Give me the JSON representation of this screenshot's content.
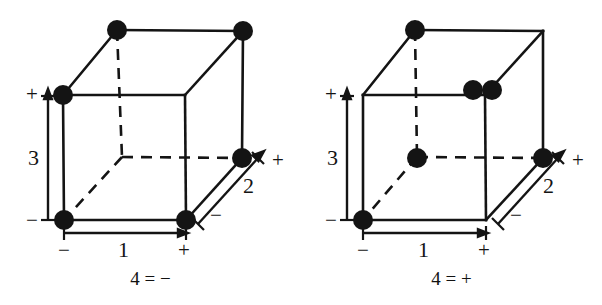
{
  "figure": {
    "type": "two-panel-cube-diagram",
    "background_color": "#ffffff",
    "line_color": "#141414",
    "dot_color": "#141414",
    "width": 602,
    "height": 305
  },
  "geometry": {
    "front_face": {
      "top_left": [
        63,
        95
      ],
      "top_right": [
        185,
        95
      ],
      "bottom_left": [
        64,
        220
      ],
      "bottom_right": [
        186,
        220
      ]
    },
    "back_face": {
      "top_left": [
        117,
        30
      ],
      "top_right": [
        243,
        31
      ],
      "bottom_left": [
        122,
        157
      ],
      "bottom_right": [
        242,
        158
      ]
    },
    "hidden_edges_dashed": [
      "back_bottom_left-back_top_left",
      "back_bottom_left-back_bottom_right",
      "back_bottom_left-front_bottom_left"
    ]
  },
  "axes": {
    "axis_1": {
      "name": "1",
      "minus": "−",
      "plus": "+",
      "orientation": "horizontal",
      "arrow_direction": "right"
    },
    "axis_2": {
      "name": "2",
      "minus": "−",
      "plus": "+",
      "orientation": "diagonal",
      "arrow_direction": "up-right"
    },
    "axis_3": {
      "name": "3",
      "minus": "−",
      "plus": "+",
      "orientation": "vertical",
      "arrow_direction": "up"
    }
  },
  "panels": [
    {
      "id": "panel-left",
      "caption": "4 = −",
      "factor_4_level": "−",
      "points": [
        {
          "label": "back-top-left",
          "cx": 117,
          "cy": 30,
          "r": 10
        },
        {
          "label": "back-top-right",
          "cx": 243,
          "cy": 31,
          "r": 10
        },
        {
          "label": "front-top-left",
          "cx": 63,
          "cy": 95,
          "r": 10
        },
        {
          "label": "back-bottom-right",
          "cx": 242,
          "cy": 158,
          "r": 10
        },
        {
          "label": "front-bottom-left",
          "cx": 64,
          "cy": 220,
          "r": 10
        },
        {
          "label": "front-bottom-right",
          "cx": 186,
          "cy": 220,
          "r": 10
        }
      ],
      "design_runs": [
        {
          "f1": "−",
          "f2": "+",
          "f3": "+",
          "f4": "−"
        },
        {
          "f1": "+",
          "f2": "+",
          "f3": "+",
          "f4": "−"
        },
        {
          "f1": "−",
          "f2": "−",
          "f3": "+",
          "f4": "−"
        },
        {
          "f1": "+",
          "f2": "+",
          "f3": "−",
          "f4": "−"
        },
        {
          "f1": "−",
          "f2": "−",
          "f3": "−",
          "f4": "−"
        },
        {
          "f1": "+",
          "f2": "−",
          "f3": "−",
          "f4": "−"
        }
      ]
    },
    {
      "id": "panel-right",
      "caption": "4 = +",
      "factor_4_level": "+",
      "points": [
        {
          "label": "back-top-left",
          "cx": 114,
          "cy": 30,
          "r": 10
        },
        {
          "label": "front-top-right-pair-a",
          "cx": 172,
          "cy": 90,
          "r": 10
        },
        {
          "label": "front-top-right-pair-b",
          "cx": 191,
          "cy": 90,
          "r": 10
        },
        {
          "label": "back-bottom-left",
          "cx": 116,
          "cy": 158,
          "r": 10
        },
        {
          "label": "back-bottom-right",
          "cx": 242,
          "cy": 158,
          "r": 10
        },
        {
          "label": "front-bottom-left",
          "cx": 62,
          "cy": 220,
          "r": 10
        }
      ],
      "design_runs": [
        {
          "f1": "−",
          "f2": "+",
          "f3": "+",
          "f4": "+"
        },
        {
          "f1": "+",
          "f2": "−",
          "f3": "+",
          "f4": "+"
        },
        {
          "f1": "+",
          "f2": "+",
          "f3": "+",
          "f4": "+"
        },
        {
          "f1": "−",
          "f2": "+",
          "f3": "−",
          "f4": "+"
        },
        {
          "f1": "+",
          "f2": "+",
          "f3": "−",
          "f4": "+"
        },
        {
          "f1": "−",
          "f2": "−",
          "f3": "−",
          "f4": "+"
        }
      ]
    }
  ]
}
